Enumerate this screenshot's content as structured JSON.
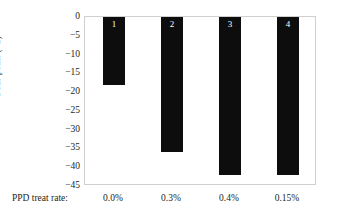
{
  "chart_data": {
    "type": "bar",
    "title": "",
    "subtitle": "",
    "xlabel": "PPD treat rate:",
    "ylabel": "Pour point (°C)",
    "categories": [
      "0.0%",
      "0.3%",
      "0.4%",
      "0.15%"
    ],
    "values": [
      -18,
      -36,
      -42,
      -42
    ],
    "bar_labels": [
      "1",
      "2",
      "3",
      "4"
    ],
    "ylim": [
      -45,
      0
    ],
    "ytick_labels": [
      "0",
      "−5",
      "−10",
      "−15",
      "−20",
      "−25",
      "−30",
      "−35",
      "−40",
      "−45"
    ],
    "ytick_values": [
      0,
      -5,
      -10,
      -15,
      -20,
      -25,
      -30,
      -35,
      -40,
      -45
    ],
    "grid": false,
    "legend": "none",
    "bar_color": "#0d0d0d",
    "bar_label_color": "#ffffff",
    "plot_border_color": "#cfcfcf",
    "background_color": "#ffffff",
    "text_color": "#231f20"
  }
}
